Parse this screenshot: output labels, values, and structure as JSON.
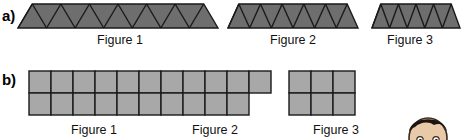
{
  "figure": {
    "type": "math-worksheet-pattern-figure",
    "background_color": "#ffffff"
  },
  "rows": [
    {
      "id": "a",
      "label": "a)",
      "shape_type": "triangle-strip",
      "fill_color": "#6e6e6e",
      "stroke_color": "#1a1a1a",
      "figures": [
        {
          "caption": "Figure 1",
          "triangle_count": 13,
          "strip_x": 18,
          "strip_y": 4,
          "strip_width": 200,
          "strip_height": 24,
          "caption_x": 70,
          "caption_y": 34,
          "caption_width": 100
        },
        {
          "caption": "Figure 2",
          "triangle_count": 11,
          "strip_x": 228,
          "strip_y": 4,
          "strip_width": 130,
          "strip_height": 24,
          "caption_x": 243,
          "caption_y": 34,
          "caption_width": 100
        },
        {
          "caption": "Figure 3",
          "triangle_count": 9,
          "strip_x": 372,
          "strip_y": 4,
          "strip_width": 88,
          "strip_height": 24,
          "caption_x": 360,
          "caption_y": 34,
          "caption_width": 100
        }
      ]
    },
    {
      "id": "b",
      "label": "b)",
      "shape_type": "square-grid",
      "fill_color": "#a8a8a8",
      "stroke_color": "#1a1a1a",
      "cell_size": 22,
      "figures": [
        {
          "caption": "Figure 1",
          "top_row_squares": 6,
          "bottom_row_squares": 6,
          "total_squares": 12,
          "grid_x": 28,
          "grid_y": 70,
          "caption_x": 28,
          "caption_y": 124,
          "caption_width": 132
        },
        {
          "caption": "Figure 2",
          "top_row_squares": 5,
          "bottom_row_squares": 4,
          "total_squares": 9,
          "grid_x": 160,
          "grid_y": 70,
          "caption_x": 152,
          "caption_y": 124,
          "caption_width": 126
        },
        {
          "caption": "Figure 3",
          "top_row_squares": 3,
          "bottom_row_squares": 3,
          "total_squares": 6,
          "grid_x": 288,
          "grid_y": 70,
          "caption_x": 270,
          "caption_y": 124,
          "caption_width": 132
        }
      ]
    }
  ],
  "decoration": {
    "avatar": {
      "name": "cartoon-boy-face",
      "hair_color": "#1c1410",
      "skin_color": "#e8c9a8",
      "outline_color": "#3a2a1e"
    }
  }
}
